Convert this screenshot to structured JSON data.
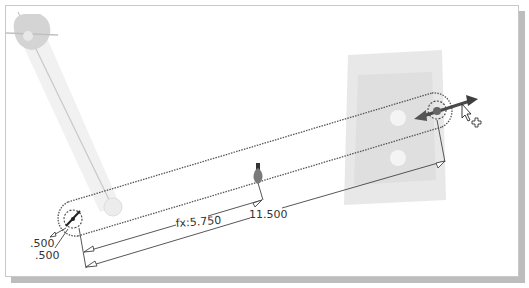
{
  "viewport": {
    "background": "#ffffff",
    "frame_border": "#c8c8c8",
    "shadow": "#bdbdbd"
  },
  "sketch": {
    "link_length_label": "11.500",
    "center_distance_label": "fx:5.750",
    "hole_dim_1": ".500",
    "hole_dim_2": ".500"
  },
  "colors": {
    "sketch_line": "#555555",
    "dimension_line": "#444444",
    "ghost_geometry": "#d9d9d9",
    "ghost_plate": "#e3e3e3",
    "drag_arrow": "#4a4a4a",
    "grip_point": "#777777"
  },
  "icons": {
    "cursor": "arrow-pointer-icon",
    "move_cross": "move-plus-icon",
    "drag_handle": "drag-arrow-icon",
    "grip": "grip-point-icon"
  }
}
